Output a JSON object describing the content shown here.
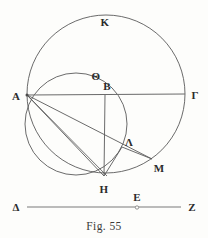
{
  "figure": {
    "caption": "Fig. 55",
    "background_color": "#fdfdfb",
    "stroke_color": "#5a5a5a",
    "label_color": "#2b2b2b",
    "labels": [
      {
        "key": "K",
        "text": "K",
        "x": 105,
        "y": 22
      },
      {
        "key": "Theta",
        "text": "Θ",
        "x": 96,
        "y": 76
      },
      {
        "key": "B",
        "text": "B",
        "x": 107,
        "y": 86
      },
      {
        "key": "A",
        "text": "A",
        "x": 16,
        "y": 96
      },
      {
        "key": "Gamma",
        "text": "Γ",
        "x": 195,
        "y": 95
      },
      {
        "key": "Lambda",
        "text": "Λ",
        "x": 129,
        "y": 142
      },
      {
        "key": "M",
        "text": "M",
        "x": 159,
        "y": 168
      },
      {
        "key": "H",
        "text": "H",
        "x": 104,
        "y": 189
      },
      {
        "key": "Delta",
        "text": "Δ",
        "x": 16,
        "y": 207
      },
      {
        "key": "E",
        "text": "E",
        "x": 137,
        "y": 197
      },
      {
        "key": "Z",
        "text": "Z",
        "x": 192,
        "y": 207
      }
    ],
    "points": {
      "A": {
        "x": 27,
        "y": 95
      },
      "B": {
        "x": 105,
        "y": 95
      },
      "Gamma": {
        "x": 185,
        "y": 94
      },
      "Lambda": {
        "x": 122,
        "y": 148
      },
      "M": {
        "x": 152,
        "y": 159
      },
      "H": {
        "x": 104,
        "y": 176
      },
      "Delta": {
        "x": 27,
        "y": 207
      },
      "E": {
        "x": 137,
        "y": 207
      },
      "Z": {
        "x": 181,
        "y": 207
      }
    },
    "big_circle": {
      "cx": 106,
      "cy": 94,
      "r": 79
    },
    "small_circle": {
      "cx": 76,
      "cy": 124,
      "r": 51
    }
  }
}
